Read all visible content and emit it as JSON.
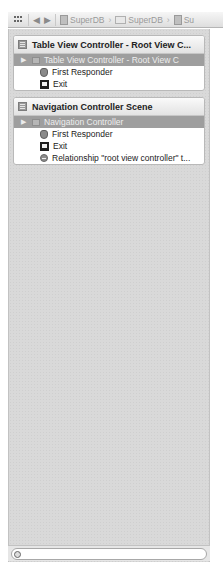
{
  "navbar": {
    "icons": {
      "related": "grid-icon",
      "back": "back-arrow-icon",
      "forward": "forward-arrow-icon"
    },
    "back_label": "◀",
    "forward_label": "▶",
    "breadcrumbs": [
      {
        "label": "SuperDB",
        "icon": "project-icon"
      },
      {
        "label": "SuperDB",
        "icon": "folder-icon"
      },
      {
        "label": "Su",
        "icon": "storyboard-file-icon"
      }
    ],
    "chevron": "›"
  },
  "scenes": [
    {
      "title": "Table View Controller - Root View C...",
      "rows": [
        {
          "label": "Table View Controller - Root View C",
          "icon": "view-controller-icon",
          "selected": true,
          "disclosure": "▶"
        },
        {
          "label": "First Responder",
          "icon": "first-responder-icon",
          "selected": false
        },
        {
          "label": "Exit",
          "icon": "exit-icon",
          "selected": false
        }
      ]
    },
    {
      "title": "Navigation Controller Scene",
      "rows": [
        {
          "label": "Navigation Controller",
          "icon": "navigation-controller-icon",
          "selected": true,
          "disclosure": "▶"
        },
        {
          "label": "First Responder",
          "icon": "first-responder-icon",
          "selected": false
        },
        {
          "label": "Exit",
          "icon": "exit-icon",
          "selected": false
        },
        {
          "label": "Relationship \"root view controller\" t...",
          "icon": "relationship-segue-icon",
          "selected": false
        }
      ]
    }
  ],
  "filter": {
    "value": "",
    "placeholder": ""
  },
  "colors": {
    "selection": "#9e9e9e",
    "panel_background": "#d9d9d9",
    "scene_header": "#e8e8e8"
  }
}
